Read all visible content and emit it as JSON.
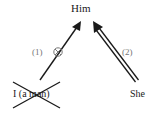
{
  "nodes": {
    "top": "Him",
    "bottom_left": "I (a man)",
    "bottom_right": "She"
  },
  "arrows": [
    {
      "label": "(1)",
      "from": "I (a man)",
      "to": "Him",
      "style": "single-line",
      "blocked_marker": "circled-x"
    },
    {
      "label": "(2)",
      "from": "She",
      "to": "Him",
      "style": "double-line"
    }
  ],
  "crossed_out": "I (a man)",
  "colors": {
    "ink": "#1a1a1a",
    "label": "#777777"
  }
}
